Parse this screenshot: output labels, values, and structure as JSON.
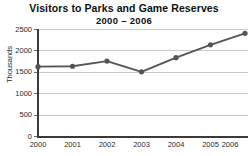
{
  "chart_data": {
    "type": "line",
    "title": "Visitors to Parks and Game Reserves",
    "subtitle": "2000 – 2006",
    "xlabel": "",
    "ylabel": "Thousands",
    "categories": [
      "2000",
      "2001",
      "2002",
      "2003",
      "2004",
      "2005",
      "2006"
    ],
    "values": [
      1620,
      1630,
      1750,
      1500,
      1830,
      2130,
      2400
    ],
    "series": [
      {
        "name": "Visitors",
        "values": [
          1620,
          1630,
          1750,
          1500,
          1830,
          2130,
          2400
        ],
        "color": "#555555",
        "marker": "circle"
      }
    ],
    "ylim": [
      0,
      2500
    ],
    "yticks": [
      0,
      500,
      1000,
      1500,
      2000,
      2500
    ],
    "ytick_labels": [
      "0",
      "500",
      "1000",
      "1500",
      "2000",
      "2500"
    ],
    "xtick_labels": [
      "2000",
      "2001",
      "2002",
      "2003",
      "2004",
      "2005",
      "2006"
    ],
    "grid": true,
    "grid_axis": "y",
    "grid_color": "#c9c9c9",
    "legend": false,
    "legend_position": "none",
    "axis_color": "#3a3a3a",
    "background": "#ffffff"
  },
  "figure": {
    "title_main": "Visitors to Parks and Game Reserves",
    "title_sub": "2000 – 2006",
    "y_axis_title": "Thousands"
  }
}
